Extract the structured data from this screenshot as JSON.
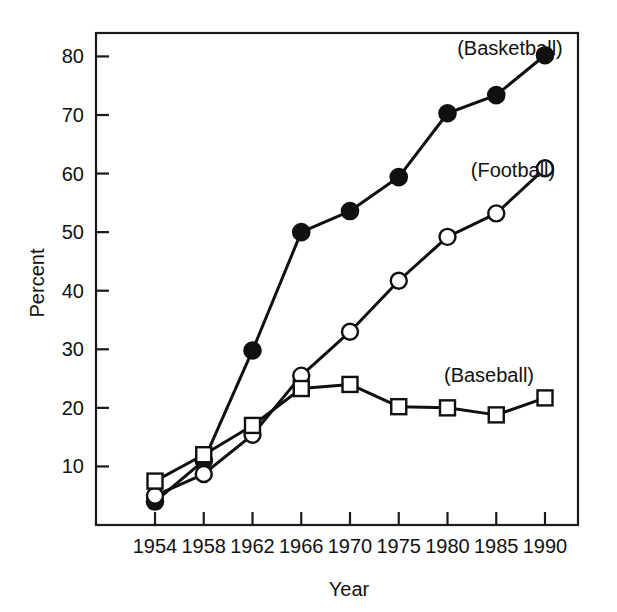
{
  "chart_data": {
    "type": "line",
    "title": "",
    "xlabel": "Year",
    "ylabel": "Percent",
    "categories": [
      "1954",
      "1958",
      "1962",
      "1966",
      "1970",
      "1975",
      "1980",
      "1985",
      "1990"
    ],
    "x_tick_labels": [
      "1954",
      "1958",
      "1962",
      "1966",
      "1970",
      "1975",
      "1980",
      "1985",
      "1990"
    ],
    "y_tick_labels": [
      "10",
      "20",
      "30",
      "40",
      "50",
      "60",
      "70",
      "80"
    ],
    "y_ticks": [
      10,
      20,
      30,
      40,
      50,
      60,
      70,
      80
    ],
    "ylim": [
      0,
      84
    ],
    "grid": false,
    "legend_position": "inline-annotations",
    "series": [
      {
        "name": "(Basketball)",
        "marker": "filled-circle",
        "annotation": "(Basketball)",
        "values": [
          4.0,
          11.0,
          29.8,
          50.0,
          53.6,
          59.4,
          70.3,
          73.4,
          80.2
        ]
      },
      {
        "name": "(Football)",
        "marker": "open-circle",
        "annotation": "(Football)",
        "values": [
          5.0,
          8.7,
          15.4,
          25.5,
          33.0,
          41.7,
          49.2,
          53.2,
          60.9
        ]
      },
      {
        "name": "(Baseball)",
        "marker": "open-square",
        "annotation": "(Baseball)",
        "values": [
          7.5,
          12.0,
          17.0,
          23.3,
          24.0,
          20.2,
          20.0,
          18.8,
          21.7
        ]
      }
    ],
    "annotations": [
      {
        "text": "(Basketball)",
        "x_px": 510,
        "y_px": 55
      },
      {
        "text": "(Football)",
        "x_px": 513,
        "y_px": 177
      },
      {
        "text": "(Baseball)",
        "x_px": 489,
        "y_px": 382
      }
    ],
    "colors": {
      "line": "#101010",
      "marker_fill_filled": "#101010",
      "marker_fill_open": "#ffffff",
      "axis": "#1a1a1a",
      "background": "#ffffff"
    }
  }
}
